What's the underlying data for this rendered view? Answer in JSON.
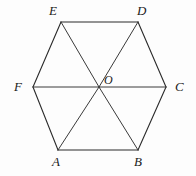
{
  "figure": {
    "type": "regular-hexagon-with-diagonals",
    "stroke_color": "#2b2b2b",
    "background_color": "#fdfdfd",
    "stroke_width": 1,
    "vertices": [
      {
        "id": "E",
        "label": "E",
        "x": 61,
        "y": 22
      },
      {
        "id": "D",
        "label": "D",
        "x": 138,
        "y": 22
      },
      {
        "id": "C",
        "label": "C",
        "x": 166,
        "y": 87
      },
      {
        "id": "B",
        "label": "B",
        "x": 138,
        "y": 150
      },
      {
        "id": "A",
        "label": "A",
        "x": 58,
        "y": 150
      },
      {
        "id": "F",
        "label": "F",
        "x": 33,
        "y": 87
      }
    ],
    "center": {
      "id": "O",
      "label": "O",
      "x": 99,
      "y": 87
    },
    "perimeter_edges": [
      {
        "from": "E",
        "to": "D"
      },
      {
        "from": "D",
        "to": "C"
      },
      {
        "from": "C",
        "to": "B"
      },
      {
        "from": "B",
        "to": "A"
      },
      {
        "from": "A",
        "to": "F"
      },
      {
        "from": "F",
        "to": "E"
      }
    ],
    "radii": [
      {
        "from": "O",
        "to": "E"
      },
      {
        "from": "O",
        "to": "D"
      },
      {
        "from": "O",
        "to": "C"
      },
      {
        "from": "O",
        "to": "B"
      },
      {
        "from": "O",
        "to": "A"
      },
      {
        "from": "O",
        "to": "F"
      }
    ]
  }
}
